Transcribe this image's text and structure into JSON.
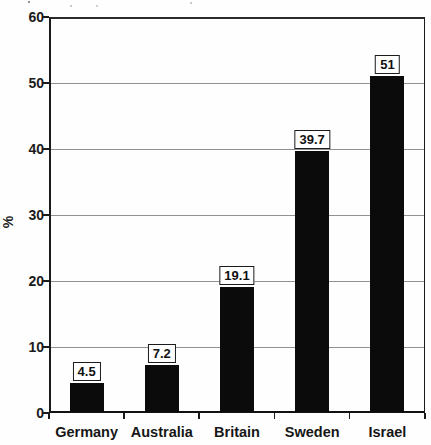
{
  "chart_data": {
    "type": "bar",
    "title": "",
    "xlabel": "",
    "ylabel": "%",
    "categories": [
      "Germany",
      "Australia",
      "Britain",
      "Sweden",
      "Israel"
    ],
    "values": [
      4.5,
      7.2,
      19.1,
      39.7,
      51
    ],
    "value_labels": [
      "4.5",
      "7.2",
      "19.1",
      "39.7",
      "51"
    ],
    "ylim": [
      0,
      60
    ],
    "yticks": [
      0,
      10,
      20,
      30,
      40,
      50,
      60
    ],
    "grid": true,
    "legend_position": "none",
    "bar_color": "#0b0b0b",
    "gridline_color": "#919191",
    "value_label_boxed": true
  }
}
